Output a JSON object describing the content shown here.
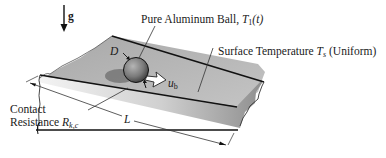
{
  "diagram": {
    "type": "physics-schematic",
    "gravity": {
      "label": "g"
    },
    "ball": {
      "label_prefix": "Pure Aluminum Ball,",
      "temp_symbol": "T",
      "temp_sub": "1",
      "temp_arg": "(t)",
      "diameter_symbol": "D",
      "velocity_symbol": "u",
      "velocity_sub": "b"
    },
    "surface": {
      "label_prefix": "Surface Temperature",
      "temp_symbol": "T",
      "temp_sub": "s",
      "label_suffix": "(Uniform)"
    },
    "contact": {
      "line1": "Contact",
      "line2_prefix": "Resistance",
      "symbol": "R",
      "sub": "k,c"
    },
    "length": {
      "symbol": "L"
    },
    "colors": {
      "plate_top": "#b8b8b8",
      "plate_edge_light": "#f0f0f0",
      "plate_edge_dark": "#8c8c8c",
      "ball_light": "#a9a9a9",
      "ball_dark": "#4a4a4a",
      "outline": "#111111"
    }
  }
}
